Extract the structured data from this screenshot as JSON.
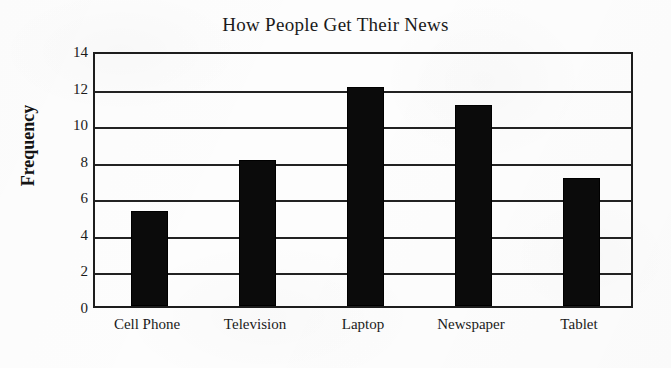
{
  "chart_data": {
    "type": "bar",
    "title": "How People Get Their News",
    "xlabel": "",
    "ylabel": "Frequency",
    "categories": [
      "Cell Phone",
      "Television",
      "Laptop",
      "Newspaper",
      "Tablet"
    ],
    "values": [
      5.2,
      8,
      12,
      11,
      7
    ],
    "ylim": [
      0,
      14
    ],
    "ytick_labels": [
      "0",
      "2",
      "4",
      "6",
      "8",
      "10",
      "12",
      "14"
    ],
    "ytick_values": [
      0,
      2,
      4,
      6,
      8,
      10,
      12,
      14
    ],
    "grid": "horizontal",
    "legend": "none",
    "bar_color": "#0b0b0b",
    "axis_color": "#1d1d1d",
    "background_color": "#fdfdfd"
  }
}
